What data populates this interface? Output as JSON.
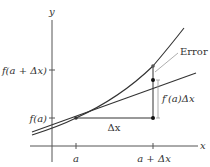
{
  "diagram": {
    "axes": {
      "x_label": "x",
      "y_label": "y"
    },
    "x_ticks": [
      {
        "label": "a"
      },
      {
        "label": "a + Δx"
      }
    ],
    "y_ticks": [
      {
        "label": "f(a)"
      },
      {
        "label": "f(a + Δx)"
      }
    ],
    "annotations": {
      "error": "Error",
      "rise": "f′(a)Δx",
      "run": "Δx"
    },
    "colors": {
      "curve": "#333333",
      "tangent": "#333333",
      "error_leader": "#999999",
      "axis": "#555555",
      "background": "#ffffff"
    }
  }
}
